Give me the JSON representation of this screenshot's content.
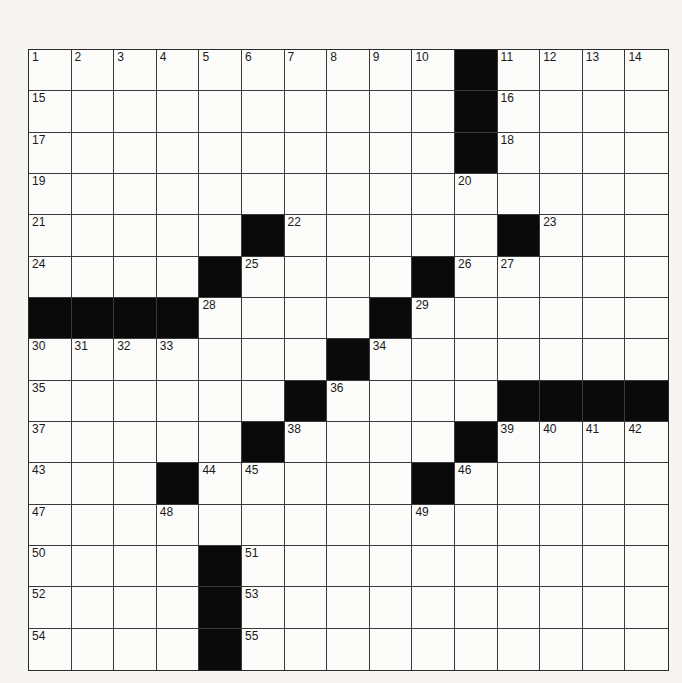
{
  "puzzle": {
    "rows": 15,
    "cols": 15,
    "colors": {
      "black_square": "#0a0a0a",
      "white_square": "#fcfcfa",
      "grid_line": "#3a3a3a",
      "number_text": "#1a1a1a"
    },
    "layout": [
      "..........#....",
      "..........#....",
      "..........#....",
      "...............",
      ".....#.....#...",
      "....#....#.....",
      "####....#......",
      ".......#.......",
      "......#....####",
      ".....#....#....",
      "...#.....#.....",
      "...............",
      "....#..........",
      "....#..........",
      "....#.........."
    ],
    "numbers": [
      {
        "row": 0,
        "col": 0,
        "n": "1"
      },
      {
        "row": 0,
        "col": 1,
        "n": "2"
      },
      {
        "row": 0,
        "col": 2,
        "n": "3"
      },
      {
        "row": 0,
        "col": 3,
        "n": "4"
      },
      {
        "row": 0,
        "col": 4,
        "n": "5"
      },
      {
        "row": 0,
        "col": 5,
        "n": "6"
      },
      {
        "row": 0,
        "col": 6,
        "n": "7"
      },
      {
        "row": 0,
        "col": 7,
        "n": "8"
      },
      {
        "row": 0,
        "col": 8,
        "n": "9"
      },
      {
        "row": 0,
        "col": 9,
        "n": "10"
      },
      {
        "row": 0,
        "col": 11,
        "n": "11"
      },
      {
        "row": 0,
        "col": 12,
        "n": "12"
      },
      {
        "row": 0,
        "col": 13,
        "n": "13"
      },
      {
        "row": 0,
        "col": 14,
        "n": "14"
      },
      {
        "row": 1,
        "col": 0,
        "n": "15"
      },
      {
        "row": 1,
        "col": 11,
        "n": "16"
      },
      {
        "row": 2,
        "col": 0,
        "n": "17"
      },
      {
        "row": 2,
        "col": 11,
        "n": "18"
      },
      {
        "row": 3,
        "col": 0,
        "n": "19"
      },
      {
        "row": 3,
        "col": 10,
        "n": "20"
      },
      {
        "row": 4,
        "col": 0,
        "n": "21"
      },
      {
        "row": 4,
        "col": 6,
        "n": "22"
      },
      {
        "row": 4,
        "col": 12,
        "n": "23"
      },
      {
        "row": 5,
        "col": 0,
        "n": "24"
      },
      {
        "row": 5,
        "col": 5,
        "n": "25"
      },
      {
        "row": 5,
        "col": 10,
        "n": "26"
      },
      {
        "row": 5,
        "col": 11,
        "n": "27"
      },
      {
        "row": 6,
        "col": 4,
        "n": "28"
      },
      {
        "row": 6,
        "col": 9,
        "n": "29"
      },
      {
        "row": 7,
        "col": 0,
        "n": "30"
      },
      {
        "row": 7,
        "col": 1,
        "n": "31"
      },
      {
        "row": 7,
        "col": 2,
        "n": "32"
      },
      {
        "row": 7,
        "col": 3,
        "n": "33"
      },
      {
        "row": 7,
        "col": 8,
        "n": "34"
      },
      {
        "row": 8,
        "col": 0,
        "n": "35"
      },
      {
        "row": 8,
        "col": 7,
        "n": "36"
      },
      {
        "row": 9,
        "col": 0,
        "n": "37"
      },
      {
        "row": 9,
        "col": 6,
        "n": "38"
      },
      {
        "row": 9,
        "col": 11,
        "n": "39"
      },
      {
        "row": 9,
        "col": 12,
        "n": "40"
      },
      {
        "row": 9,
        "col": 13,
        "n": "41"
      },
      {
        "row": 9,
        "col": 14,
        "n": "42"
      },
      {
        "row": 10,
        "col": 0,
        "n": "43"
      },
      {
        "row": 10,
        "col": 4,
        "n": "44"
      },
      {
        "row": 10,
        "col": 5,
        "n": "45"
      },
      {
        "row": 10,
        "col": 10,
        "n": "46"
      },
      {
        "row": 11,
        "col": 0,
        "n": "47"
      },
      {
        "row": 11,
        "col": 3,
        "n": "48"
      },
      {
        "row": 11,
        "col": 9,
        "n": "49"
      },
      {
        "row": 12,
        "col": 0,
        "n": "50"
      },
      {
        "row": 12,
        "col": 5,
        "n": "51"
      },
      {
        "row": 13,
        "col": 0,
        "n": "52"
      },
      {
        "row": 13,
        "col": 5,
        "n": "53"
      },
      {
        "row": 14,
        "col": 0,
        "n": "54"
      },
      {
        "row": 14,
        "col": 5,
        "n": "55"
      }
    ]
  }
}
